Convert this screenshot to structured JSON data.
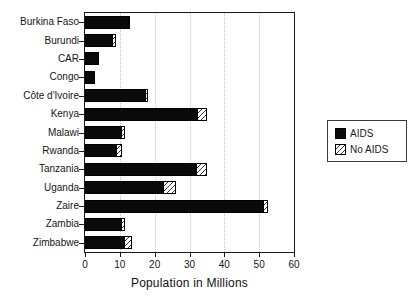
{
  "figure": {
    "background": "#ffffff",
    "text_color": "#1a1a1a"
  },
  "chart_data": {
    "type": "bar",
    "orientation": "horizontal-stacked",
    "title": "",
    "xlabel": "Population in Millions",
    "ylabel": "",
    "xlim": [
      0,
      60
    ],
    "xticks": [
      0,
      10,
      20,
      30,
      40,
      50,
      60
    ],
    "xtick_labels": [
      "0",
      "10",
      "20",
      "30",
      "40",
      "50",
      "60"
    ],
    "grid": "vertical dotted gridlines at 10,20,30,40,50",
    "legend_position": "right-middle, boxed",
    "categories": [
      "Burkina Faso",
      "Burundi",
      "CAR",
      "Congo",
      "Côte d'Ivoire",
      "Kenya",
      "Malawi",
      "Rwanda",
      "Tanzania",
      "Uganda",
      "Zaire",
      "Zambia",
      "Zimbabwe"
    ],
    "series": [
      {
        "name": "AIDS",
        "style": "solid-black",
        "values": [
          12.5,
          8,
          4,
          3,
          17.5,
          32.5,
          10.5,
          9,
          32,
          22.5,
          51.5,
          10.5,
          11.5
        ]
      },
      {
        "name": "No AIDS",
        "style": "diagonal-hatch",
        "note": "total bar length (projection without AIDS); hatched segment = total minus AIDS value",
        "values": [
          13,
          9,
          4,
          3,
          18,
          35,
          11.5,
          10.5,
          35,
          26,
          52.5,
          11.5,
          13.5
        ]
      }
    ],
    "colors": {
      "aids_fill": "#0a0a0a",
      "hatch_line": "#3a3a3a",
      "gridline": "#c3c3c3",
      "frame": "#1a1a1a"
    }
  },
  "legend": {
    "entries": [
      {
        "label": "AIDS"
      },
      {
        "label": "No AIDS"
      }
    ]
  }
}
